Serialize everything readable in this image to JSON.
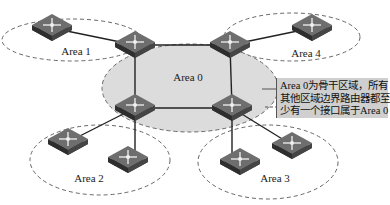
{
  "diagram": {
    "areas": [
      {
        "id": "area0",
        "label": "Area 0",
        "role": "backbone"
      },
      {
        "id": "area1",
        "label": "Area 1"
      },
      {
        "id": "area2",
        "label": "Area 2"
      },
      {
        "id": "area3",
        "label": "Area 3"
      },
      {
        "id": "area4",
        "label": "Area 4"
      }
    ],
    "callout": {
      "lines": [
        "Area 0为骨干区域，所有",
        "其他区域边界路由器都至",
        "少有一个接口属于Area 0"
      ]
    },
    "colors": {
      "backbone_fill": "#dcdcdc",
      "callout_fill": "#cfcfcf",
      "router_top": "#6b6b6b",
      "router_side": "#3a3a3a",
      "link": "#222222",
      "dashed_border": "#666666"
    }
  }
}
